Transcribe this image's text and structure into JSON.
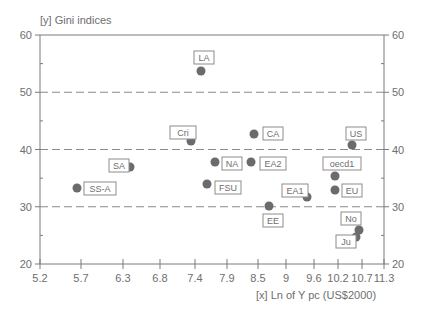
{
  "chart_data": {
    "type": "scatter",
    "title": "",
    "ylabel": "[y] Gini indices",
    "xlabel": "[x] Ln of Y pc (US$2000)",
    "ylim": [
      20,
      60
    ],
    "xlim": [
      5.2,
      11.3
    ],
    "y_ticks": [
      "20",
      "30",
      "40",
      "50",
      "60"
    ],
    "x_ticks": [
      "5.2",
      "5.7",
      "6.3",
      "6.8",
      "7.4",
      "7.9",
      "8.5",
      "9",
      "9.6",
      "10.2",
      "10.7",
      "11.3"
    ],
    "x_tick_px": [
      40,
      81,
      123,
      160,
      195,
      227,
      258,
      286,
      314,
      338,
      362,
      384
    ],
    "gridlines_y": [
      30,
      40,
      50
    ],
    "grid": "dashed horizontal",
    "points": [
      {
        "label": "SS-A",
        "x": 5.65,
        "y": 43.0,
        "px": 77,
        "py": 188,
        "lx": 84,
        "ly": 182
      },
      {
        "label": "SA",
        "x": 6.4,
        "y": 36.8,
        "px": 130,
        "py": 167,
        "lx": 109,
        "ly": 159
      },
      {
        "label": "LA",
        "x": 7.5,
        "y": 53.7,
        "px": 201,
        "py": 71,
        "lx": 194,
        "ly": 51
      },
      {
        "label": "Cri",
        "x": 7.35,
        "y": 41.5,
        "px": 191,
        "py": 141,
        "lx": 170,
        "ly": 126
      },
      {
        "label": "NA",
        "x": 7.65,
        "y": 37.8,
        "px": 215,
        "py": 162,
        "lx": 222,
        "ly": 157
      },
      {
        "label": "FSU",
        "x": 7.55,
        "y": 34.0,
        "px": 207,
        "py": 184,
        "lx": 215,
        "ly": 181
      },
      {
        "label": "CA",
        "x": 8.4,
        "y": 42.7,
        "px": 254,
        "py": 134,
        "lx": 263,
        "ly": 127
      },
      {
        "label": "EA2",
        "x": 8.35,
        "y": 38.0,
        "px": 251,
        "py": 162,
        "lx": 260,
        "ly": 157
      },
      {
        "label": "EA1",
        "x": 9.45,
        "y": 31.7,
        "px": 307,
        "py": 197,
        "lx": 282,
        "ly": 184
      },
      {
        "label": "EE",
        "x": 8.7,
        "y": 30.1,
        "px": 269,
        "py": 206,
        "lx": 263,
        "ly": 214
      },
      {
        "label": "US",
        "x": 10.55,
        "y": 40.8,
        "px": 352,
        "py": 145,
        "lx": 346,
        "ly": 127
      },
      {
        "label": "oecd1",
        "x": 10.15,
        "y": 35.3,
        "px": 335,
        "py": 176,
        "lx": 323,
        "ly": 157
      },
      {
        "label": "EU",
        "x": 10.15,
        "y": 32.8,
        "px": 335,
        "py": 190,
        "lx": 342,
        "ly": 184
      },
      {
        "label": "No",
        "x": 10.7,
        "y": 26.0,
        "px": 359,
        "py": 230,
        "lx": 341,
        "ly": 212
      },
      {
        "label": "Ju",
        "x": 10.65,
        "y": 24.5,
        "px": 356,
        "py": 237,
        "lx": 336,
        "ly": 235
      }
    ],
    "colors": {
      "point": "#6b6b6b",
      "axis": "#7a7a7a",
      "grid": "#8a8a8a",
      "text": "#6e6e6e",
      "label_border": "#8c8c8c"
    }
  }
}
